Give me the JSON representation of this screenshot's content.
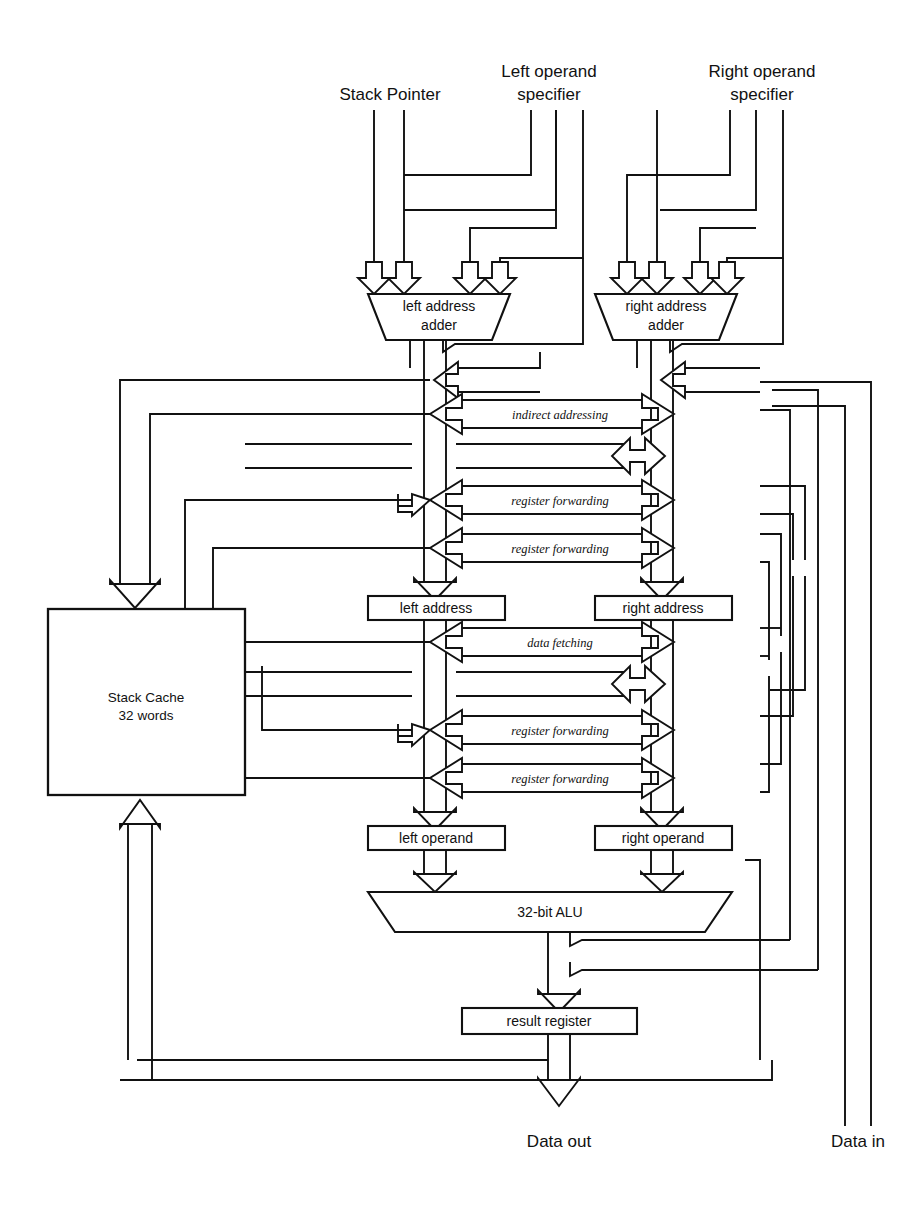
{
  "diagram": {
    "inputs": [
      {
        "id": "stack-pointer",
        "label_line1": "Stack Pointer",
        "label_line2": ""
      },
      {
        "id": "left-operand-specifier",
        "label_line1": "Left operand",
        "label_line2": "specifier"
      },
      {
        "id": "right-operand-specifier",
        "label_line1": "Right operand",
        "label_line2": "specifier"
      }
    ],
    "blocks": [
      {
        "id": "left-address-adder",
        "label_line1": "left address",
        "label_line2": "adder",
        "shape": "trapezoid"
      },
      {
        "id": "right-address-adder",
        "label_line1": "right address",
        "label_line2": "adder",
        "shape": "trapezoid"
      },
      {
        "id": "stack-cache",
        "label_line1": "Stack Cache",
        "label_line2": "32 words",
        "shape": "rect"
      },
      {
        "id": "left-address",
        "label_line1": "left address",
        "label_line2": "",
        "shape": "rect"
      },
      {
        "id": "right-address",
        "label_line1": "right address",
        "label_line2": "",
        "shape": "rect"
      },
      {
        "id": "left-operand",
        "label_line1": "left operand",
        "label_line2": "",
        "shape": "rect"
      },
      {
        "id": "right-operand",
        "label_line1": "right operand",
        "label_line2": "",
        "shape": "rect"
      },
      {
        "id": "alu",
        "label_line1": "32-bit ALU",
        "label_line2": "",
        "shape": "trapezoid"
      },
      {
        "id": "result-register",
        "label_line1": "result register",
        "label_line2": "",
        "shape": "rect"
      }
    ],
    "path_labels": [
      {
        "id": "indirect-addressing",
        "text": "indirect addressing"
      },
      {
        "id": "register-forwarding-1",
        "text": "register forwarding"
      },
      {
        "id": "register-forwarding-2",
        "text": "register forwarding"
      },
      {
        "id": "data-fetching",
        "text": "data fetching"
      },
      {
        "id": "register-forwarding-3",
        "text": "register forwarding"
      },
      {
        "id": "register-forwarding-4",
        "text": "register forwarding"
      }
    ],
    "io": [
      {
        "id": "data-out",
        "label": "Data out"
      },
      {
        "id": "data-in",
        "label": "Data in"
      }
    ],
    "colors": {
      "line": "#111111",
      "fill": "#ffffff",
      "background": "#ffffff"
    }
  }
}
